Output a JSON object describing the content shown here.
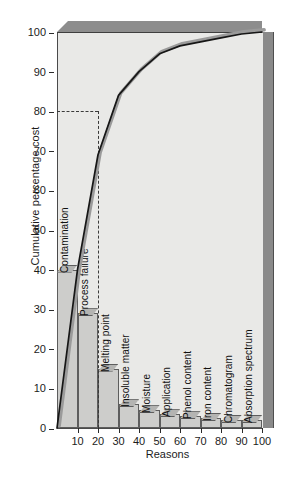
{
  "chart_data": {
    "type": "bar",
    "title": "",
    "xlabel": "Reasons",
    "ylabel": "Cumulative percentage cost",
    "ylim": [
      0,
      100
    ],
    "xlim": [
      0,
      100
    ],
    "grid": false,
    "legend": "none",
    "categories": [
      "Contamination",
      "Process failure",
      "Melting point",
      "Insoluble matter",
      "Moisture",
      "Application",
      "Phenol content",
      "Iron content",
      "Chromatogram",
      "Absorption spectrum"
    ],
    "values": [
      40,
      29,
      15,
      6,
      4.5,
      3.5,
      3,
      2.5,
      2,
      2
    ],
    "series": [
      {
        "name": "Individual percentage cost",
        "type": "bar",
        "values": [
          40,
          29,
          15,
          6,
          4.5,
          3.5,
          3,
          2.5,
          2,
          2
        ]
      },
      {
        "name": "Cumulative percentage cost",
        "type": "line",
        "values": [
          40,
          69,
          84,
          90,
          94.5,
          96.5,
          97.5,
          98.5,
          99.5,
          100
        ]
      }
    ],
    "ytick_labels": [
      "0",
      "10",
      "20",
      "30",
      "40",
      "50",
      "60",
      "70",
      "80",
      "90",
      "100"
    ],
    "ytick_values": [
      0,
      10,
      20,
      30,
      40,
      50,
      60,
      70,
      80,
      90,
      100
    ],
    "xtick_labels": [
      "10",
      "20",
      "30",
      "40",
      "50",
      "60",
      "70",
      "80",
      "90",
      "100"
    ],
    "xtick_values": [
      10,
      20,
      30,
      40,
      50,
      60,
      70,
      80,
      90,
      100
    ],
    "annotations": [
      {
        "name": "eighty-percent-guide",
        "type": "dashed-reference",
        "y": 80,
        "x": 20,
        "description": "Dashed guide from 80% on the y-axis across to the cumulative curve, then down to the x-axis at 20"
      }
    ],
    "style": {
      "bar_fill": "#cdcdcb",
      "bar_edge": "#5d5d5d",
      "bar_top": "#b4b4b2",
      "plot_background": "#e9e9e7",
      "wall_shade": "#8a8a8a",
      "line_color": "#1a1a1a",
      "line_shadow_color": "#9a9a9a",
      "guide_color": "#3a3a3a",
      "three_d": true
    }
  },
  "figure": {
    "caption": ""
  }
}
